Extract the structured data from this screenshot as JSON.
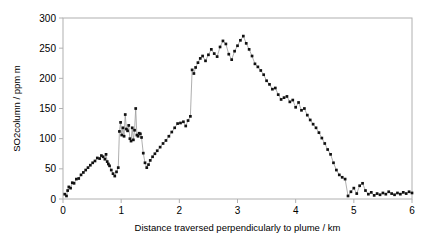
{
  "figure": {
    "background": "#ffffff",
    "frame_color": "#b0b0b0",
    "marker_color": "#111111",
    "line_color": "#9a9a9a"
  },
  "chart_data": {
    "type": "scatter",
    "title": "",
    "subtitle": "",
    "xlabel": "Distance traversed perpendicularly to plume / km",
    "ylabel": "SO2column / ppm m",
    "xlim": [
      0,
      6
    ],
    "ylim": [
      0,
      300
    ],
    "xticks": [
      0,
      1,
      2,
      3,
      4,
      5,
      6
    ],
    "yticks": [
      0,
      50,
      100,
      150,
      200,
      250,
      300
    ],
    "xtick_labels": [
      "0",
      "1",
      "2",
      "3",
      "4",
      "5",
      "6"
    ],
    "ytick_labels": [
      "0",
      "50",
      "100",
      "150",
      "200",
      "250",
      "300"
    ],
    "grid": false,
    "legend": null,
    "legend_position": "none",
    "marker": "filled-square",
    "connected": true,
    "series": [
      {
        "name": "SO2 column",
        "x": [
          0.03,
          0.06,
          0.08,
          0.1,
          0.13,
          0.16,
          0.19,
          0.23,
          0.27,
          0.31,
          0.35,
          0.39,
          0.43,
          0.47,
          0.51,
          0.55,
          0.59,
          0.63,
          0.66,
          0.69,
          0.72,
          0.74,
          0.76,
          0.78,
          0.8,
          0.83,
          0.86,
          0.89,
          0.92,
          0.95,
          0.97,
          0.99,
          1.01,
          1.03,
          1.05,
          1.07,
          1.09,
          1.11,
          1.13,
          1.15,
          1.17,
          1.19,
          1.21,
          1.23,
          1.25,
          1.27,
          1.29,
          1.31,
          1.33,
          1.35,
          1.38,
          1.41,
          1.44,
          1.47,
          1.5,
          1.54,
          1.58,
          1.62,
          1.67,
          1.72,
          1.77,
          1.82,
          1.87,
          1.92,
          1.97,
          2.02,
          2.07,
          2.11,
          2.15,
          2.19,
          2.22,
          2.25,
          2.28,
          2.32,
          2.36,
          2.4,
          2.45,
          2.5,
          2.55,
          2.6,
          2.65,
          2.7,
          2.75,
          2.8,
          2.85,
          2.9,
          2.95,
          3.0,
          3.05,
          3.1,
          3.15,
          3.2,
          3.25,
          3.3,
          3.35,
          3.4,
          3.45,
          3.5,
          3.55,
          3.6,
          3.65,
          3.7,
          3.75,
          3.8,
          3.85,
          3.9,
          3.95,
          4.0,
          4.05,
          4.1,
          4.15,
          4.2,
          4.25,
          4.3,
          4.35,
          4.4,
          4.45,
          4.5,
          4.55,
          4.6,
          4.65,
          4.7,
          4.75,
          4.8,
          4.85,
          4.9,
          4.95,
          5.0,
          5.05,
          5.1,
          5.15,
          5.2,
          5.25,
          5.3,
          5.35,
          5.4,
          5.45,
          5.5,
          5.55,
          5.6,
          5.65,
          5.7,
          5.75,
          5.8,
          5.85,
          5.9,
          5.95,
          6.0
        ],
        "y": [
          8,
          5,
          14,
          20,
          18,
          27,
          26,
          33,
          34,
          40,
          44,
          48,
          52,
          56,
          60,
          63,
          68,
          67,
          72,
          70,
          66,
          74,
          62,
          58,
          55,
          48,
          42,
          38,
          45,
          52,
          112,
          127,
          106,
          118,
          104,
          140,
          116,
          113,
          122,
          100,
          96,
          118,
          98,
          114,
          150,
          106,
          104,
          109,
          108,
          102,
          76,
          60,
          52,
          57,
          64,
          70,
          75,
          80,
          86,
          92,
          97,
          104,
          111,
          118,
          125,
          126,
          128,
          121,
          130,
          137,
          214,
          208,
          218,
          226,
          233,
          237,
          229,
          239,
          248,
          241,
          236,
          252,
          262,
          257,
          240,
          231,
          245,
          254,
          263,
          270,
          258,
          248,
          237,
          224,
          219,
          213,
          206,
          196,
          190,
          182,
          184,
          173,
          165,
          168,
          170,
          161,
          164,
          152,
          160,
          147,
          150,
          139,
          131,
          124,
          118,
          110,
          101,
          92,
          82,
          74,
          60,
          48,
          40,
          36,
          33,
          5,
          12,
          18,
          9,
          22,
          26,
          14,
          8,
          11,
          6,
          9,
          7,
          10,
          8,
          12,
          9,
          7,
          10,
          8,
          11,
          9,
          12,
          10
        ]
      }
    ]
  }
}
